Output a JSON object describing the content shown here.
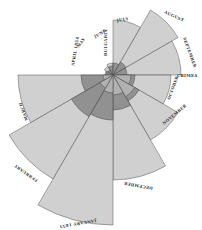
{
  "chart_data": {
    "type": "polar-area",
    "center": [
      113,
      75
    ],
    "start_angle_deg": 180,
    "direction": "clockwise",
    "categories": [
      "APRIL 1854",
      "MAY",
      "JUNE",
      "JULY",
      "AUGUST",
      "SEPTEMBER",
      "OCTOBER",
      "NOVEMBER",
      "DECEMBER",
      "JANUARY 1855",
      "FEBRUARY",
      "MARCH"
    ],
    "series": [
      {
        "name": "Preventible disease",
        "color": "#c8c8c8",
        "radii": [
          8,
          10,
          12,
          55,
          75,
          68,
          58,
          75,
          105,
          150,
          120,
          95
        ]
      },
      {
        "name": "Other causes",
        "color": "#8a8a8a",
        "radii": [
          7,
          6,
          9,
          12,
          15,
          14,
          22,
          30,
          35,
          45,
          48,
          32
        ]
      },
      {
        "name": "Wounds",
        "color": "#b5b5b5",
        "radii": [
          0,
          0,
          0,
          0,
          0,
          0,
          18,
          25,
          20,
          18,
          15,
          10
        ]
      }
    ],
    "annotations": [
      "BULGARIA",
      "CRIMEA"
    ]
  },
  "labels": {
    "april": "APRIL 1854",
    "may": "MAY",
    "june": "JUNE",
    "july": "JULY",
    "august": "AUGUST",
    "september": "SEPTEMBER",
    "october": "OCTOBER",
    "november": "NOVEMBER",
    "december": "DECEMBER",
    "january": "JANUARY 1855",
    "february": "FEBRUARY",
    "march": "MARCH",
    "bulgaria": "BULGARIA",
    "crimea": "CRIMEA"
  }
}
